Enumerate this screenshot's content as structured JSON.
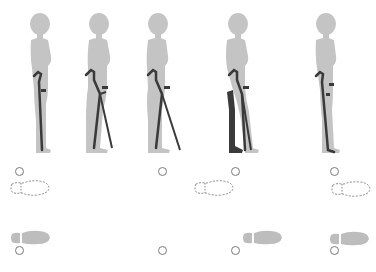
{
  "diagram": {
    "type": "crutch-gait-sequence",
    "colors": {
      "body": "#c4c4c4",
      "crutch": "#3a3a3a",
      "highlight_leg": "#3a3a3a",
      "footprint_filled": "#bdbdbd",
      "footprint_outline": "#8a8a8a",
      "crutch_tip_marker": "#7a7a7a",
      "background": "#ffffff"
    },
    "steps": [
      {
        "index": 1,
        "pose": "standing-crutches-beside",
        "highlight_leg": false,
        "markers": {
          "top_circle": true,
          "dashed_foot": true,
          "filled_foot": true,
          "bottom_circle": true
        }
      },
      {
        "index": 2,
        "pose": "crutches-forward",
        "highlight_leg": false,
        "markers": {
          "top_circle": false,
          "dashed_foot": false,
          "filled_foot": false,
          "bottom_circle": false
        }
      },
      {
        "index": 3,
        "pose": "crutches-forward-leaning",
        "highlight_leg": false,
        "markers": {
          "top_circle": true,
          "dashed_foot": false,
          "filled_foot": false,
          "bottom_circle": true
        }
      },
      {
        "index": 4,
        "pose": "affected-leg-forward",
        "highlight_leg": true,
        "markers": {
          "top_circle": true,
          "dashed_foot": true,
          "filled_foot": true,
          "bottom_circle": true
        }
      },
      {
        "index": 5,
        "pose": "standing-feet-together",
        "highlight_leg": false,
        "markers": {
          "top_circle": true,
          "dashed_foot": true,
          "filled_foot": true,
          "bottom_circle": true
        }
      }
    ]
  }
}
